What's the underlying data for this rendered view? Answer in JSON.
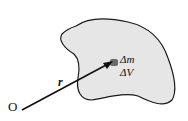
{
  "diagram": {
    "origin_label": "O",
    "vector_label": "r",
    "mass_label": "Δm",
    "volume_label": "ΔV",
    "colors": {
      "body_fill": "#e6e6e6",
      "outline": "#1a1a1a",
      "element": "#6b6b6b",
      "arrow": "#111111"
    }
  }
}
